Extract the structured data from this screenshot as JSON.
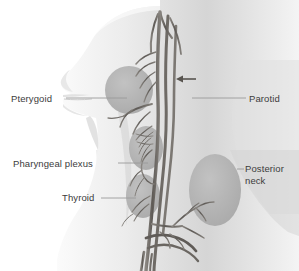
{
  "figure": {
    "background_color": "#ffffff",
    "skin_color": "#d9d9d9",
    "skin_color_light": "#f2f2f2",
    "region_color": "#b4b4b4",
    "nerve_color": "#6e6a66",
    "nerve_color_dark": "#4a4642",
    "leader_color": "#8c8c8c",
    "text_color": "#3c3c3c"
  },
  "labels": {
    "pterygoid": "Pterygoid",
    "pharyngeal_plexus": "Pharyngeal plexus",
    "thyroid": "Thyroid",
    "parotid": "Parotid",
    "posterior_neck": "Posterior\nneck",
    "posterior_neck_line1": "Posterior",
    "posterior_neck_line2": "neck"
  },
  "annotations": {
    "arrow": "arrow-pointing-left-at-parotid"
  },
  "regions": [
    {
      "name": "pterygoid-region",
      "shape": "circle",
      "cx": 129,
      "cy": 90,
      "r": 24
    },
    {
      "name": "pharyngeal-plexus-region",
      "shape": "ellipse",
      "cx": 146,
      "cy": 148,
      "rx": 17,
      "ry": 22
    },
    {
      "name": "thyroid-region",
      "shape": "ellipse",
      "cx": 143,
      "cy": 196,
      "rx": 17,
      "ry": 22
    },
    {
      "name": "posterior-neck-region",
      "shape": "ellipse",
      "cx": 215,
      "cy": 190,
      "rx": 26,
      "ry": 36
    }
  ]
}
